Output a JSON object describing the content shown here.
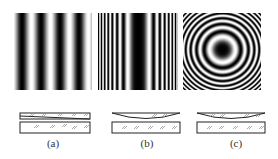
{
  "figure": {
    "panels": [
      {
        "id": "a",
        "caption": "(a)",
        "pattern": "straight equally spaced fringes",
        "setup": "wedge air film between two flat plates"
      },
      {
        "id": "b",
        "caption": "(b)",
        "pattern": "straight fringes, denser toward both edges",
        "setup": "cylindrical lens on flat plate"
      },
      {
        "id": "c",
        "caption": "(c)",
        "pattern": "concentric circular rings (Newton's rings)",
        "setup": "spherical lens on flat plate"
      }
    ]
  },
  "colors": {
    "ink": "#222222",
    "hatch": "#888888",
    "background": "#ffffff"
  }
}
